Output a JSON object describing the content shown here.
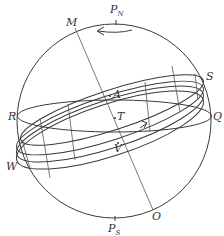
{
  "diagram": {
    "type": "celestial-sphere",
    "labels": {
      "north_pole": "P",
      "north_pole_sub": "N",
      "south_pole": "P",
      "south_pole_sub": "S",
      "M": "M",
      "O": "O",
      "R": "R",
      "Q": "Q",
      "S": "S",
      "W": "W",
      "A": "A",
      "T": "T",
      "V": "V"
    },
    "elements": [
      "outer sphere circle",
      "rotation arrow near top pointing left",
      "axis line M to O",
      "equator ellipse R to Q",
      "inclined band of ellipses through S and W",
      "direction arrow on band pointing right"
    ]
  }
}
